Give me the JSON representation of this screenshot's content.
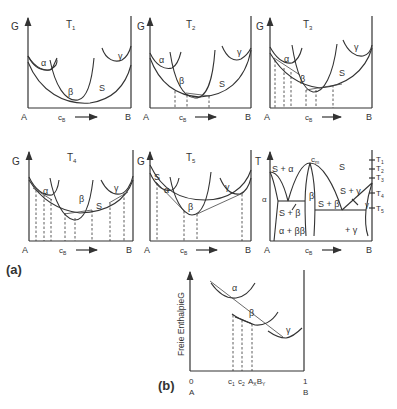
{
  "figure": {
    "part_a_label": "(a)",
    "part_b_label": "(b)"
  },
  "panels": [
    {
      "temp": "T",
      "temp_sub": "1",
      "y_label": "G",
      "x_left": "A",
      "x_right": "B",
      "x_label": "c",
      "x_label_sub": "B",
      "curves": {
        "alpha": "α",
        "beta": "β",
        "gamma": "γ",
        "S": "S"
      }
    },
    {
      "temp": "T",
      "temp_sub": "2",
      "y_label": "G",
      "x_left": "A",
      "x_right": "B",
      "x_label": "c",
      "x_label_sub": "B",
      "curves": {
        "alpha": "α",
        "beta": "β",
        "gamma": "γ",
        "S": "S"
      }
    },
    {
      "temp": "T",
      "temp_sub": "3",
      "y_label": "",
      "x_left": "A",
      "x_right": "B",
      "x_label": "c",
      "x_label_sub": "B",
      "curves": {
        "alpha": "α",
        "beta": "β",
        "gamma": "γ",
        "S": "S"
      }
    },
    {
      "temp": "T",
      "temp_sub": "4",
      "y_label": "G",
      "x_left": "A",
      "x_right": "B",
      "x_label": "c",
      "x_label_sub": "B",
      "curves": {
        "alpha": "α",
        "beta": "β",
        "gamma": "γ",
        "S": "S"
      }
    },
    {
      "temp": "T",
      "temp_sub": "5",
      "y_label": "G",
      "x_left": "A",
      "x_right": "B",
      "x_label": "c",
      "x_label_sub": "B",
      "curves": {
        "alpha": "α",
        "beta": "β",
        "gamma": "γ",
        "S": "S"
      }
    }
  ],
  "phase_diagram": {
    "y_label": "T",
    "x_left": "A",
    "x_right": "B",
    "x_label": "c",
    "x_label_sub": "B",
    "cm_label": "c",
    "cm_sub": "m",
    "temps": [
      {
        "t": "T",
        "sub": "1"
      },
      {
        "t": "T",
        "sub": "2"
      },
      {
        "t": "T",
        "sub": "3"
      },
      {
        "t": "T",
        "sub": "4"
      },
      {
        "t": "T",
        "sub": "5"
      }
    ],
    "regions": {
      "s_alpha": "S + α",
      "S": "S",
      "alpha": "α",
      "s_beta_left": "S + β",
      "beta": "β",
      "s_beta_right": "S + β",
      "s_gamma": "S + γ",
      "gamma": "γ",
      "alpha_beta": "α + ββ",
      "plus_gamma": "+ γ"
    }
  },
  "panel_b": {
    "y_label": "Freie EnthalpieG",
    "x_zero": "0",
    "x_one": "1",
    "x_left": "A",
    "x_right": "B",
    "c1": "c",
    "c1_sub": "1",
    "c2": "c",
    "c2_sub": "2",
    "compound": "A",
    "compound_x": "X",
    "compound_b": "B",
    "compound_y": "Y",
    "curves": {
      "alpha": "α",
      "beta": "β",
      "gamma": "γ"
    }
  }
}
